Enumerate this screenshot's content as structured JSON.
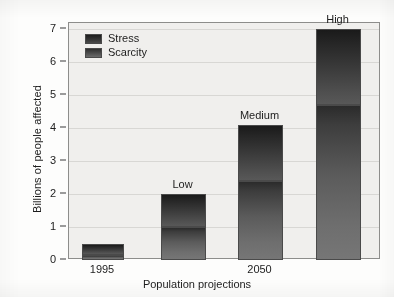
{
  "chart_data": {
    "type": "bar",
    "title": "",
    "xlabel": "Population projections",
    "ylabel": "Billions of people affected",
    "ylim": [
      0,
      7.35
    ],
    "yticks": [
      0,
      1,
      2,
      3,
      4,
      5,
      6,
      7
    ],
    "ytick_labels": [
      "0",
      "1",
      "2",
      "3",
      "4",
      "5",
      "6",
      "7"
    ],
    "grid": true,
    "legend_position": "top-left",
    "stacked": true,
    "categories": [
      "1995",
      "Low",
      "Medium",
      "High"
    ],
    "xtick_labels": [
      "1995",
      "2050"
    ],
    "bar_captions": [
      "",
      "Low",
      "Medium",
      "High"
    ],
    "series": [
      {
        "name": "Scarcity",
        "values": [
          0.15,
          1.0,
          2.4,
          4.7
        ]
      },
      {
        "name": "Stress",
        "values": [
          0.35,
          1.0,
          1.7,
          2.3
        ]
      }
    ],
    "totals": [
      0.5,
      2.0,
      4.1,
      7.0
    ],
    "bars": [
      {
        "category": "1995",
        "caption": "",
        "scarcity": 0.15,
        "stress": 0.35,
        "total": 0.5
      },
      {
        "category": "Low",
        "caption": "Low",
        "scarcity": 1.0,
        "stress": 1.0,
        "total": 2.0
      },
      {
        "category": "Medium",
        "caption": "Medium",
        "scarcity": 2.4,
        "stress": 1.7,
        "total": 4.1
      },
      {
        "category": "High",
        "caption": "High",
        "scarcity": 4.7,
        "stress": 2.3,
        "total": 7.0
      }
    ],
    "colors": {
      "stress": "#2b2b2b",
      "scarcity": "#5b5b5b",
      "plot_background": "#f0efed",
      "grid": "#d8d7d4",
      "axis": "#3a3a3a",
      "text": "#1d1d1d"
    }
  },
  "legend": {
    "items": [
      {
        "label": "Stress"
      },
      {
        "label": "Scarcity"
      }
    ]
  },
  "axes": {
    "y_label": "Billions of people affected",
    "x_label": "Population projections"
  }
}
